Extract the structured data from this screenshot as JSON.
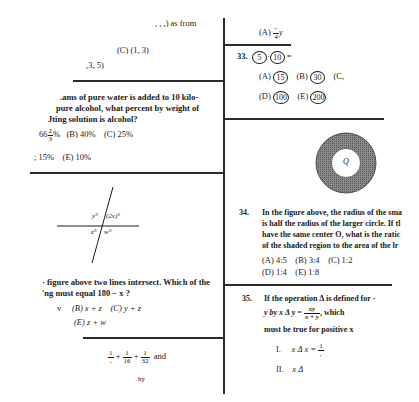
{
  "left_column": {
    "q31_fragment": {
      "stem_tail": ", , ,) as from",
      "choice_c": "(C)  (1, 3)",
      "choice_partial": ",3, 5)"
    },
    "q32": {
      "lines": [
        ".ams of pure water is added to 10 kilo-",
        "pure alcohol, what percent by weight of",
        "Jting solution is alcohol?"
      ],
      "choice_a_whole": "66",
      "choice_a_num": "2",
      "choice_a_den": "3",
      "choice_a_suffix": "%",
      "choice_b": "(B)  40%",
      "choice_c": "(C)  25%",
      "choice_d": "; 15%",
      "choice_e": "(E)  10%"
    },
    "q33_figure": {
      "labels": {
        "y": "y°",
        "two_x": "(2x)°",
        "z": "z°",
        "w": "w°"
      }
    },
    "q33_text": {
      "lines": [
        "· figure above two lines intersect.  Which of the",
        "'ng must equal   180 − x ?"
      ],
      "choice_a_partial": "v",
      "choice_b": "(B)  x + z",
      "choice_c": "(C)  y + z",
      "choice_e": "(E)  z + w"
    },
    "q_sum": {
      "fracs": [
        {
          "num": "1",
          "den": ","
        },
        {
          "num": "1",
          "den": "16"
        },
        {
          "num": "1",
          "den": "32"
        }
      ],
      "plus": "+",
      "and_text": "and",
      "tail": "hy"
    }
  },
  "right_column": {
    "q32_fragment": {
      "choice_a_label": "(A)",
      "choice_a_num": "−",
      "choice_a_den": "4",
      "choice_a_var": "y"
    },
    "q33": {
      "number": "33.",
      "circ1": "5",
      "dot": "·",
      "circ2": "10",
      "equals": "=",
      "choices": [
        {
          "label": "(A)",
          "value": "15"
        },
        {
          "label": "(B)",
          "value": "30"
        },
        {
          "label": "(C,",
          "value": ""
        },
        {
          "label": "(D)",
          "value": "100"
        },
        {
          "label": "(E)",
          "value": "200"
        }
      ]
    },
    "q34_figure": {
      "center_label": "Q",
      "shade_color": "#6e6e6e"
    },
    "q34": {
      "number": "34.",
      "lines": [
        "In the figure above, the radius of the sma",
        "is half the radius of the larger circle.  If tl",
        "have the same center  O, what is the ratic",
        "of the shaded region to the area of the lr"
      ],
      "choices_row1": [
        "(A)  4:5",
        "(B)  3:4",
        "(C)  1:2"
      ],
      "choices_row2": [
        "(D)  1:4",
        "(E)  1:8"
      ]
    },
    "q35": {
      "number": "35.",
      "line1": "If the operation  Δ  is defined for ·",
      "line2_pre": "y  by  x Δ y =",
      "frac_num": "xy",
      "frac_den": "x + y",
      "line2_post": ",  which",
      "line3": "must be true for positive  x",
      "item1_label": "I.",
      "item1_text": "x Δ x =",
      "item1_num": "1",
      "item1_den": ",",
      "item2_label": "II.",
      "item2_text": "x Δ"
    }
  }
}
